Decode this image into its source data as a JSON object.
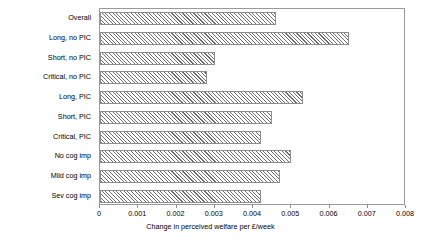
{
  "chart_data": {
    "type": "bar",
    "orientation": "horizontal",
    "title": "",
    "xlabel": "Change in perceived welfare per £/week",
    "ylabel": "",
    "xlim": [
      0,
      0.008
    ],
    "xticks": [
      "0",
      "0.001",
      "0.002",
      "0.003",
      "0.004",
      "0.005",
      "0.006",
      "0.007",
      "0.008"
    ],
    "xtick_values": [
      0,
      0.001,
      0.002,
      0.003,
      0.004,
      0.005,
      0.006,
      0.007,
      0.008
    ],
    "grid": false,
    "legend": null,
    "categories": [
      "Overall",
      "Long, no PIC",
      "Short, no PIC",
      "Critical, no PIC",
      "Long, PIC",
      "Short, PIC",
      "Critical, PIC",
      "No cog imp",
      "Mild cog imp",
      "Sev cog imp"
    ],
    "values": [
      0.0046,
      0.0065,
      0.003,
      0.0028,
      0.0053,
      0.0045,
      0.0042,
      0.005,
      0.0047,
      0.0042
    ],
    "bar_style": {
      "fill": "diagonal-hatch",
      "hatch_color": "#6e6e6e",
      "background_color": "#ffffff",
      "border_color": "#8d8d8d"
    },
    "axis_color": "#9a9a9a",
    "text_color": "#000000",
    "plot_background": "#ffffff"
  }
}
